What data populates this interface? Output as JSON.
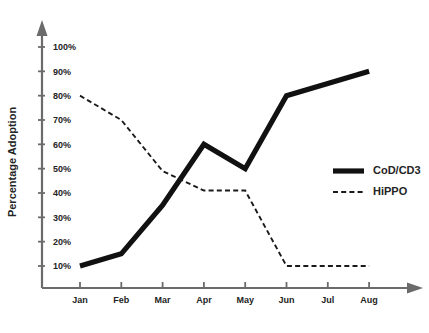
{
  "chart_data": {
    "type": "line",
    "title": "",
    "xlabel": "",
    "ylabel": "Percentage Adoption",
    "categories": [
      "Jan",
      "Feb",
      "Mar",
      "Apr",
      "May",
      "Jun",
      "Jul",
      "Aug"
    ],
    "ylim": [
      0,
      105
    ],
    "yticks": [
      10,
      20,
      30,
      40,
      50,
      60,
      70,
      80,
      90,
      100
    ],
    "ytick_labels": [
      "10%",
      "20%",
      "30%",
      "40%",
      "50%",
      "60%",
      "70%",
      "80%",
      "90%",
      "100%"
    ],
    "grid": false,
    "legend_position": "center-right",
    "series": [
      {
        "name": "CoD/CD3",
        "style": "solid",
        "width": "thick",
        "color": "#111111",
        "values": [
          10,
          15,
          35,
          60,
          50,
          80,
          85,
          90
        ]
      },
      {
        "name": "HiPPO",
        "style": "dashed",
        "width": "thin",
        "color": "#1a1a1a",
        "values": [
          80,
          70,
          49,
          41,
          41,
          10,
          10,
          10
        ]
      }
    ]
  },
  "axes": {
    "y_axis_arrow": "arrow-up-icon",
    "x_axis_arrow": "arrow-right-icon",
    "axis_color": "#6b6b6b"
  },
  "legend": {
    "entries": [
      {
        "label": "CoD/CD3",
        "swatch": "thick-solid-line-icon"
      },
      {
        "label": "HiPPO",
        "swatch": "thin-dashed-line-icon"
      }
    ]
  }
}
